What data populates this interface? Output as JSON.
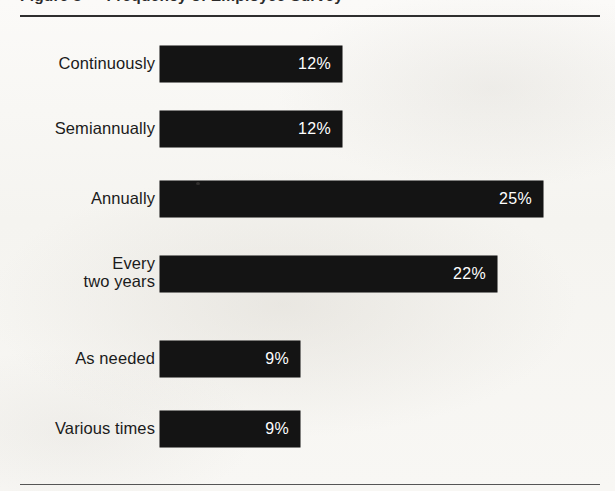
{
  "figure": {
    "caption": "Figure 3 — Frequency of Employee Survey",
    "caption_clipped": true
  },
  "chart_data": {
    "type": "bar",
    "orientation": "horizontal",
    "title": "Figure 3 — Frequency of Employee Survey",
    "xlabel": "",
    "ylabel": "",
    "grid": false,
    "legend": false,
    "value_suffix": "%",
    "categories": [
      "Continuously",
      "Semiannually",
      "Annually",
      "Every two years",
      "As needed",
      "Various times"
    ],
    "values": [
      12,
      12,
      25,
      22,
      9,
      9
    ],
    "labels": [
      "12%",
      "12%",
      "25%",
      "22%",
      "9%",
      "9%"
    ],
    "bar_color": "#141414",
    "value_label_color": "#ffffff",
    "background_color": "#f7f6f3"
  },
  "rows": [
    {
      "label_line1": "Continuously",
      "label_line2": "",
      "two_line": false,
      "value": "12%",
      "bar_px": 182,
      "top_px": 16
    },
    {
      "label_line1": "Semiannually",
      "label_line2": "",
      "two_line": false,
      "value": "12%",
      "bar_px": 182,
      "top_px": 81
    },
    {
      "label_line1": "Annually",
      "label_line2": "",
      "two_line": false,
      "value": "25%",
      "bar_px": 383,
      "top_px": 151
    },
    {
      "label_line1": "Every",
      "label_line2": "two years",
      "two_line": true,
      "value": "22%",
      "bar_px": 337,
      "top_px": 226
    },
    {
      "label_line1": "As needed",
      "label_line2": "",
      "two_line": false,
      "value": "9%",
      "bar_px": 140,
      "top_px": 311
    },
    {
      "label_line1": "Various times",
      "label_line2": "",
      "two_line": false,
      "value": "9%",
      "bar_px": 140,
      "top_px": 381
    }
  ]
}
